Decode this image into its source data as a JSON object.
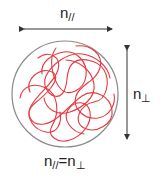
{
  "diagram": {
    "top_label": {
      "base": "n",
      "sub": "//"
    },
    "right_label": {
      "base": "n",
      "sub": "⊥"
    },
    "bottom_label": {
      "lhs_base": "n",
      "lhs_sub": "//",
      "eq": "=",
      "rhs_base": "n",
      "rhs_sub": "⊥"
    },
    "colors": {
      "circle": "#8a8a8a",
      "chain": "#e8363f",
      "arrow": "#333333"
    }
  }
}
